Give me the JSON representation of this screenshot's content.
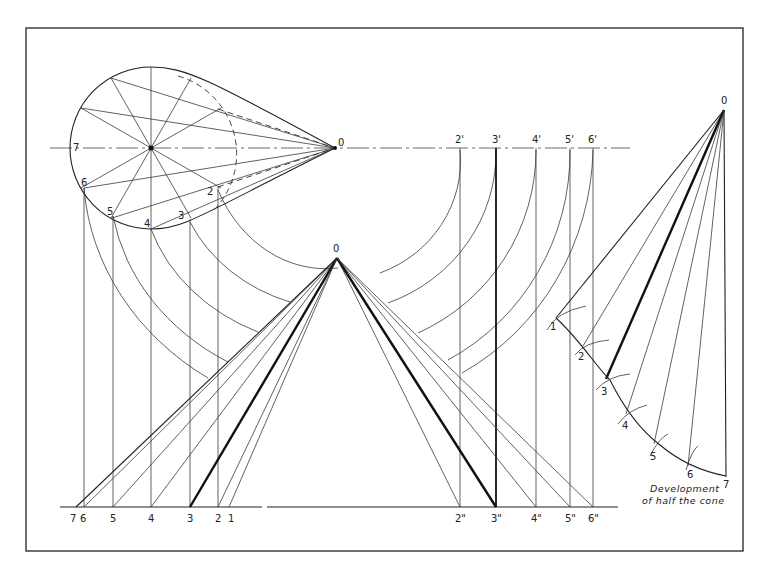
{
  "figure": {
    "caption_line1": "Development",
    "caption_line2": "of half the cone",
    "top_view": {
      "apex_label": "0",
      "point_labels": [
        "7",
        "6",
        "5",
        "4",
        "3",
        "2"
      ]
    },
    "front_view": {
      "apex_label": "0",
      "base_labels_left": [
        "7",
        "6",
        "5",
        "4",
        "3",
        "2",
        "1"
      ],
      "base_labels_right": [
        "2\"",
        "3\"",
        "4\"",
        "5\"",
        "6\""
      ]
    },
    "true_length_projection": {
      "labels": [
        "2'",
        "3'",
        "4'",
        "5'",
        "6'"
      ]
    },
    "development": {
      "apex_label": "0",
      "point_labels": [
        "1",
        "2",
        "3",
        "4",
        "5",
        "6",
        "7"
      ]
    }
  }
}
